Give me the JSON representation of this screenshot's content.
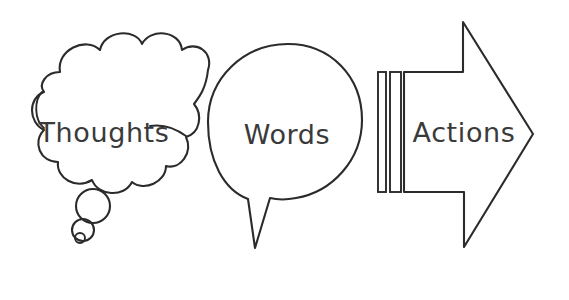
{
  "diagram": {
    "title": "Thoughts Words Actions",
    "background_color": "#ffffff",
    "stroke_color": "#2b2b2b",
    "text_color": "#3a3a3a",
    "style": "hand-drawn outline sketch",
    "nodes": [
      {
        "id": "thoughts",
        "label": "Thoughts",
        "shape": "thought-cloud",
        "icon": "thought-cloud-icon",
        "order": 1
      },
      {
        "id": "words",
        "label": "Words",
        "shape": "speech-bubble",
        "icon": "speech-bubble-icon",
        "order": 2
      },
      {
        "id": "actions",
        "label": "Actions",
        "shape": "right-arrow",
        "icon": "right-arrow-icon",
        "order": 3
      }
    ],
    "decorations": {
      "thought_trail_label": "thought trail bubbles",
      "arrow_stripes_label": "arrow tail stripes",
      "arrow_stripe_count": "2"
    }
  }
}
